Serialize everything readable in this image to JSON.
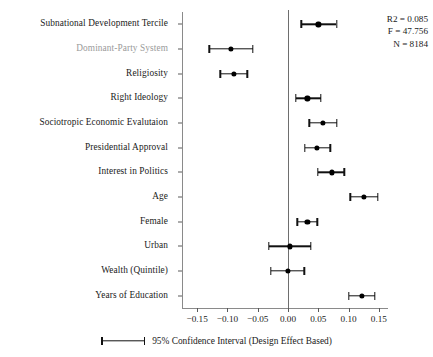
{
  "chart_data": {
    "type": "scatter",
    "plot_style": "coefficient-forest-plot",
    "title": "",
    "xlabel": "",
    "ylabel": "",
    "xlim": [
      -0.175,
      0.165
    ],
    "xticks": [
      -0.15,
      -0.1,
      -0.05,
      0.0,
      0.05,
      0.1,
      0.15
    ],
    "xticklabels": [
      "−0.15",
      "−0.10",
      "−0.05",
      "0.00",
      "0.05",
      "0.10",
      "0.15"
    ],
    "grid": false,
    "reference_line": 0.0,
    "legend_position": "bottom-center",
    "categories": [
      "Subnational Development Tercile",
      "Dominant-Party System",
      "Religiosity",
      "Right Ideology",
      "Sociotropic Economic Evalutaion",
      "Presidential Approval",
      "Interest in Politics",
      "Age",
      "Female",
      "Urban",
      "Wealth (Quintile)",
      "Years of Education"
    ],
    "points": [
      {
        "label": "Subnational Development Tercile",
        "estimate": 0.05,
        "ci_low": 0.022,
        "ci_high": 0.08,
        "muted": false
      },
      {
        "label": "Dominant-Party System",
        "estimate": -0.094,
        "ci_low": -0.13,
        "ci_high": -0.058,
        "muted": true
      },
      {
        "label": "Religiosity",
        "estimate": -0.09,
        "ci_low": -0.112,
        "ci_high": -0.067,
        "muted": false
      },
      {
        "label": "Right Ideology",
        "estimate": 0.032,
        "ci_low": 0.013,
        "ci_high": 0.054,
        "muted": false
      },
      {
        "label": "Sociotropic Economic Evalutaion",
        "estimate": 0.058,
        "ci_low": 0.035,
        "ci_high": 0.081,
        "muted": false
      },
      {
        "label": "Presidential Approval",
        "estimate": 0.048,
        "ci_low": 0.028,
        "ci_high": 0.07,
        "muted": false
      },
      {
        "label": "Interest in Politics",
        "estimate": 0.072,
        "ci_low": 0.049,
        "ci_high": 0.093,
        "muted": false
      },
      {
        "label": "Age",
        "estimate": 0.125,
        "ci_low": 0.103,
        "ci_high": 0.148,
        "muted": false
      },
      {
        "label": "Female",
        "estimate": 0.032,
        "ci_low": 0.015,
        "ci_high": 0.048,
        "muted": false
      },
      {
        "label": "Urban",
        "estimate": 0.003,
        "ci_low": -0.032,
        "ci_high": 0.038,
        "muted": false
      },
      {
        "label": "Wealth (Quintile)",
        "estimate": 0.0,
        "ci_low": -0.028,
        "ci_high": 0.027,
        "muted": false
      },
      {
        "label": "Years of Education",
        "estimate": 0.122,
        "ci_low": 0.1,
        "ci_high": 0.143,
        "muted": false
      }
    ]
  },
  "stats": {
    "r2": "R2 = 0.085",
    "f": "F = 47.756",
    "n": "N = 8184"
  },
  "legend": {
    "label": "95% Confidence Interval (Design Effect Based)"
  },
  "colors": {
    "point": "#000000",
    "whisker": "#111111",
    "axis": "#8a8a8a",
    "zero_line": "#6e6e6e",
    "label": "#1a1a1a",
    "label_muted": "#9a9a9a"
  }
}
